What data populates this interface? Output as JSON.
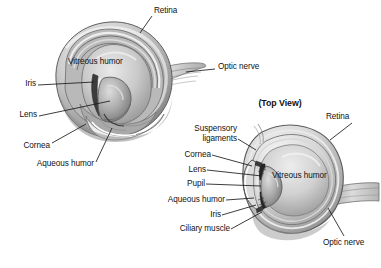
{
  "figure": {
    "title_top_view": "(Top View)",
    "background_color": "#ffffff",
    "text_color": "#111111",
    "leader_line_color": "#1a1a1a"
  },
  "left_diagram": {
    "name": "three-quarter cutaway eye",
    "labels": {
      "retina": "Retina",
      "optic_nerve": "Optic nerve",
      "vitreous_humor": "Vitreous humor",
      "iris": "Iris",
      "lens": "Lens",
      "cornea": "Cornea",
      "aqueous_humor": "Aqueous humor"
    }
  },
  "right_diagram": {
    "name": "top view cross section eye",
    "labels": {
      "retina": "Retina",
      "suspensory_ligaments_line1": "Suspensory",
      "suspensory_ligaments_line2": "ligaments",
      "cornea": "Cornea",
      "lens": "Lens",
      "pupil": "Pupil",
      "aqueous_humor": "Aqueous humor",
      "iris": "Iris",
      "ciliary_muscle": "Ciliary muscle",
      "vitreous_humor": "Vitreous humor",
      "optic_nerve": "Optic nerve"
    }
  }
}
